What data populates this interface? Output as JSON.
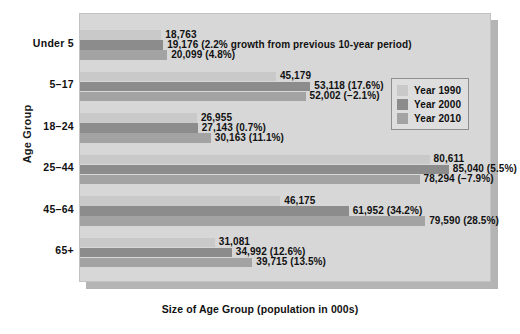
{
  "chart_data": {
    "type": "bar",
    "orientation": "horizontal",
    "title": "",
    "xlabel": "Size of Age Group (population in 000s)",
    "ylabel": "Age Group",
    "xlim": [
      0,
      95000
    ],
    "grid": false,
    "legend_position": "upper right",
    "categories": [
      "Under 5",
      "5–17",
      "18–24",
      "25–44",
      "45–64",
      "65+"
    ],
    "series": [
      {
        "name": "Year 1990",
        "color": "#c9c9c9",
        "values": [
          18763,
          45179,
          26955,
          80611,
          46175,
          31081
        ],
        "labels": [
          "18,763",
          "45,179",
          "26,955",
          "80,611",
          "46,175",
          "31,081"
        ]
      },
      {
        "name": "Year 2000",
        "color": "#8c8c8c",
        "values": [
          19176,
          53118,
          27143,
          85040,
          61952,
          34992
        ],
        "labels": [
          "19,176 (2.2% growth from previous 10-year period)",
          "53,118 (17.6%)",
          "27,143 (0.7%)",
          "85,040 (5.5%)",
          "61,952 (34.2%)",
          "34,992 (12.6%)"
        ]
      },
      {
        "name": "Year 2010",
        "color": "#a3a3a3",
        "values": [
          20099,
          52002,
          30163,
          78294,
          79590,
          39715
        ],
        "labels": [
          "20,099 (4.8%)",
          "52,002 (−2.1%)",
          "30,163 (11.1%)",
          "78,294 (−7.9%)",
          "79,590 (28.5%)",
          "39,715 (13.5%)"
        ]
      }
    ]
  },
  "axes": {
    "y_title": "Age Group",
    "x_title": "Size of Age Group (population in 000s)",
    "category_labels": [
      "Under 5",
      "5–17",
      "18–24",
      "25–44",
      "45–64",
      "65+"
    ]
  },
  "legend": {
    "items": [
      {
        "label": "Year 1990",
        "color": "#c9c9c9"
      },
      {
        "label": "Year 2000",
        "color": "#8c8c8c"
      },
      {
        "label": "Year 2010",
        "color": "#a3a3a3"
      }
    ]
  },
  "values": {
    "g0": {
      "s0": "18,763",
      "s1": "19,176 (2.2% growth from previous 10-year period)",
      "s2": "20,099 (4.8%)"
    },
    "g1": {
      "s0": "45,179",
      "s1": "53,118 (17.6%)",
      "s2": "52,002 (−2.1%)"
    },
    "g2": {
      "s0": "26,955",
      "s1": "27,143 (0.7%)",
      "s2": "30,163 (11.1%)"
    },
    "g3": {
      "s0": "80,611",
      "s1": "85,040 (5.5%)",
      "s2": "78,294 (−7.9%)"
    },
    "g4": {
      "s0": "46,175",
      "s1": "61,952 (34.2%)",
      "s2": "79,590 (28.5%)"
    },
    "g5": {
      "s0": "31,081",
      "s1": "34,992 (12.6%)",
      "s2": "39,715 (13.5%)"
    }
  }
}
